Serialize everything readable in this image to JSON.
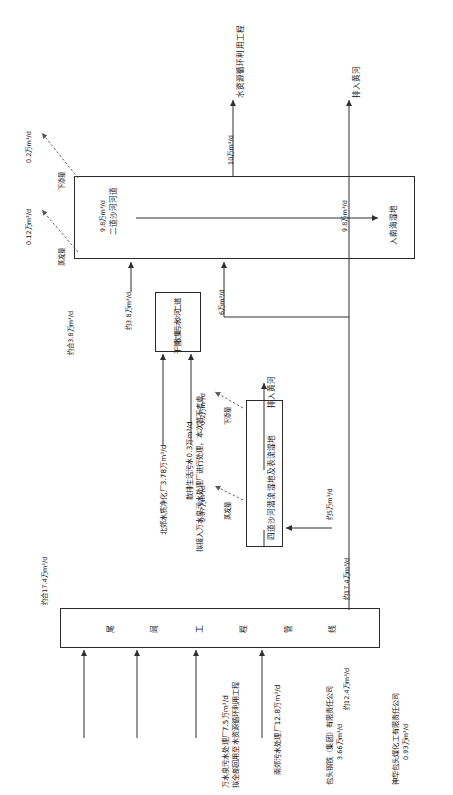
{
  "figure": {
    "type": "process-flow-diagram",
    "orientation": "rotated-90-ccw",
    "language": "zh-CN"
  },
  "nodes": {
    "erdao_channel": {
      "label": "二道沙河河道",
      "flow": "9.8万m³/d"
    },
    "sewage_trunk": {
      "label_chars": [
        "二道",
        "沙河",
        "污水",
        "收集",
        "干管"
      ],
      "label": "二道沙河污水收集干管"
    },
    "wetland": {
      "label": "四道沙河潜流湿地及表流湿地"
    },
    "tailwater_pipeline": {
      "label_chars": [
        "尾",
        "闾",
        "工",
        "程",
        "管",
        "线"
      ],
      "label": "尾闾工程管线"
    }
  },
  "terminals": {
    "recycle_project": "水资源循环利用工程",
    "to_yellow_river_top": "排入黄河",
    "to_nanhai_wetland": "入南海湿地",
    "to_yellow_river_mid": "排入黄河"
  },
  "losses": {
    "erdao_infiltration": {
      "value": "0.2万m³/d",
      "label": "下渗量"
    },
    "erdao_evaporation": {
      "value": "0.12万m³/d",
      "label": "蒸发量"
    },
    "wetland_infiltration": {
      "value": "0.2万m³/d",
      "label": "下渗量"
    },
    "wetland_evaporation": {
      "value": "0.07万m³/d",
      "label": "蒸发量"
    }
  },
  "flows": {
    "recycle_out": "10万m³/d",
    "nanhai_out": "9.8万m³/d",
    "erdao_in_channel": "9.8万m³/d",
    "trunk_to_channel": "约3.8万m³/d",
    "trunk_total": "约合3.8万m³/d",
    "beijiao_plant": "北郊水质净化厂3.78万m³/d",
    "scattered_sewage_line1": "散排生活污水0.3万m³/d",
    "scattered_sewage_line2": "拟接入万水泉污水处理厂进行处理，本次暂不考虑",
    "wetland_in": "6万m³/d",
    "wetland_feed": "约5万m³/d",
    "pipeline_total": "约17.4万m³/d",
    "pipeline_header": "约合17.4万m³/d",
    "pipeline_bypass": "约12.4万m³/d"
  },
  "sources": [
    {
      "name": "万水泉污水处理厂7.5万m³/d",
      "note": "拟全部回用至水资源循环利用工程"
    },
    {
      "name": "南郊污水处理厂12.8万m³/d",
      "note": ""
    },
    {
      "name": "包头钢铁（集团）有限责任公司",
      "note": "3.66万m³/d"
    },
    {
      "name": "神华包头煤化工有限责任公司",
      "note": "0.93万m³/d"
    }
  ],
  "colors": {
    "stroke": "#2f2f2f",
    "text": "#141414",
    "background": "#ffffff"
  }
}
